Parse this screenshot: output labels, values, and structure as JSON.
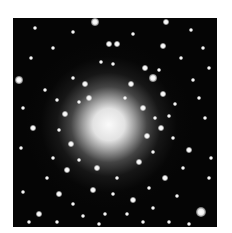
{
  "image": {
    "subject": "globular star cluster",
    "background": "#ffffff",
    "sky_color": "#050505",
    "core_center": [
      95,
      107
    ]
  },
  "stars": [
    [
      82,
      4,
      4
    ],
    [
      153,
      4,
      3
    ],
    [
      22,
      10,
      2
    ],
    [
      60,
      14,
      2
    ],
    [
      120,
      16,
      2
    ],
    [
      178,
      12,
      2
    ],
    [
      96,
      26,
      3
    ],
    [
      104,
      26,
      3
    ],
    [
      150,
      28,
      3
    ],
    [
      168,
      40,
      2
    ],
    [
      6,
      62,
      4
    ],
    [
      32,
      72,
      2
    ],
    [
      88,
      44,
      2
    ],
    [
      100,
      46,
      2
    ],
    [
      132,
      50,
      3
    ],
    [
      140,
      60,
      4
    ],
    [
      146,
      52,
      2
    ],
    [
      180,
      62,
      2
    ],
    [
      60,
      60,
      2
    ],
    [
      72,
      66,
      3
    ],
    [
      150,
      76,
      3
    ],
    [
      162,
      86,
      2
    ],
    [
      186,
      80,
      2
    ],
    [
      192,
      100,
      2
    ],
    [
      20,
      110,
      3
    ],
    [
      8,
      130,
      2
    ],
    [
      40,
      140,
      2
    ],
    [
      54,
      152,
      3
    ],
    [
      160,
      120,
      2
    ],
    [
      176,
      132,
      3
    ],
    [
      170,
      150,
      2
    ],
    [
      152,
      160,
      3
    ],
    [
      136,
      170,
      2
    ],
    [
      120,
      182,
      3
    ],
    [
      100,
      176,
      2
    ],
    [
      80,
      172,
      3
    ],
    [
      60,
      186,
      2
    ],
    [
      46,
      176,
      3
    ],
    [
      26,
      196,
      3
    ],
    [
      70,
      198,
      2
    ],
    [
      92,
      196,
      2
    ],
    [
      114,
      196,
      2
    ],
    [
      140,
      190,
      2
    ],
    [
      164,
      178,
      2
    ],
    [
      188,
      194,
      5
    ],
    [
      196,
      160,
      2
    ],
    [
      10,
      174,
      2
    ],
    [
      34,
      160,
      2
    ],
    [
      130,
      90,
      3
    ],
    [
      142,
      100,
      2
    ],
    [
      148,
      110,
      3
    ],
    [
      52,
      96,
      3
    ],
    [
      46,
      112,
      2
    ],
    [
      58,
      126,
      3
    ],
    [
      66,
      142,
      2
    ],
    [
      126,
      144,
      3
    ],
    [
      140,
      134,
      2
    ],
    [
      118,
      66,
      3
    ],
    [
      76,
      80,
      3
    ],
    [
      112,
      80,
      2
    ],
    [
      84,
      150,
      3
    ],
    [
      104,
      160,
      2
    ],
    [
      66,
      84,
      2
    ],
    [
      134,
      118,
      3
    ],
    [
      156,
      98,
      2
    ],
    [
      44,
      82,
      2
    ],
    [
      18,
      40,
      2
    ],
    [
      40,
      30,
      2
    ],
    [
      190,
      30,
      2
    ],
    [
      196,
      50,
      2
    ],
    [
      10,
      90,
      2
    ],
    [
      198,
      140,
      2
    ],
    [
      176,
      206,
      2
    ],
    [
      156,
      204,
      2
    ],
    [
      130,
      204,
      2
    ],
    [
      44,
      204,
      2
    ],
    [
      16,
      204,
      2
    ],
    [
      86,
      206,
      2
    ]
  ]
}
